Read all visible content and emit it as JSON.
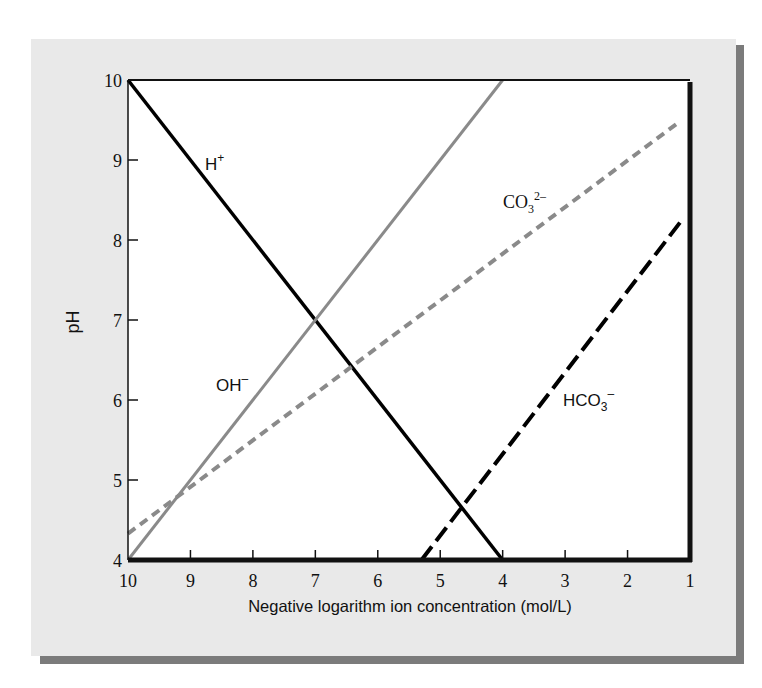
{
  "chart_data": {
    "type": "line",
    "title": "",
    "xlabel": "Negative logarithm ion concentration (mol/L)",
    "ylabel": "pH",
    "xlim": [
      10,
      1
    ],
    "ylim": [
      4,
      10
    ],
    "x_reversed": true,
    "grid": false,
    "legend_position": "inline labels",
    "x_ticks": [
      "10",
      "9",
      "8",
      "7",
      "6",
      "5",
      "4",
      "3",
      "2",
      "1"
    ],
    "y_ticks": [
      "4",
      "5",
      "6",
      "7",
      "8",
      "9",
      "10"
    ],
    "series": [
      {
        "name": "H+",
        "label_base": "H",
        "label_sup": "+",
        "style": "solid",
        "color": "#000000",
        "x": [
          10,
          4
        ],
        "y": [
          10,
          4
        ]
      },
      {
        "name": "OH-",
        "label_base": "OH",
        "label_sup": "–",
        "style": "solid",
        "color": "#8a8a8a",
        "x": [
          10,
          4
        ],
        "y": [
          4,
          10
        ]
      },
      {
        "name": "CO3 2-",
        "label_base": "CO",
        "label_sub": "3",
        "label_sup": "2–",
        "style": "short-dash",
        "color": "#8a8a8a",
        "x": [
          10,
          1.2
        ],
        "y": [
          4.33,
          9.46
        ]
      },
      {
        "name": "HCO3-",
        "label_base": "HCO",
        "label_sub": "3",
        "label_sup": "–",
        "style": "long-dash",
        "color": "#000000",
        "x": [
          5.3,
          1.1
        ],
        "y": [
          4,
          8.28
        ]
      }
    ]
  },
  "labels": {
    "h": {
      "base": "H",
      "sup": "+"
    },
    "oh": {
      "base": "OH",
      "sup": "–"
    },
    "co3": {
      "base": "CO",
      "sub": "3",
      "sup": "2–"
    },
    "hco3": {
      "base": "HCO",
      "sub": "3",
      "sup": "–"
    }
  }
}
